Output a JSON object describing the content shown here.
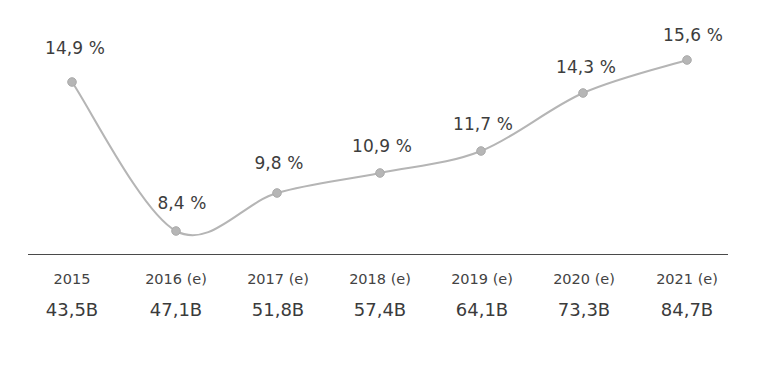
{
  "chart_data": {
    "type": "line",
    "title": "",
    "subtitle": "",
    "xlabel": "",
    "ylabel": "",
    "grid": false,
    "legend": "none",
    "categories": [
      "2015",
      "2016 (e)",
      "2017 (e)",
      "2018 (e)",
      "2019 (e)",
      "2020 (e)",
      "2021 (e)"
    ],
    "values": [
      14.9,
      8.4,
      9.8,
      10.9,
      11.7,
      14.3,
      15.6
    ],
    "point_labels": [
      "14,9 %",
      "8,4 %",
      "9,8 %",
      "10,9 %",
      "11,7 %",
      "14,3 %",
      "15,6 %"
    ],
    "secondary_labels": [
      "43,5B",
      "47,1B",
      "51,8B",
      "57,4B",
      "64,1B",
      "73,3B",
      "84,7B"
    ],
    "secondary_values": [
      43.5,
      47.1,
      51.8,
      57.4,
      64.1,
      73.3,
      84.7
    ],
    "secondary_unit": "B",
    "series": [
      {
        "name": "growth-rate-percent",
        "values": [
          14.9,
          8.4,
          9.8,
          10.9,
          11.7,
          14.3,
          15.6
        ]
      },
      {
        "name": "volume-billions",
        "values": [
          43.5,
          47.1,
          51.8,
          57.4,
          64.1,
          73.3,
          84.7
        ]
      }
    ],
    "ylim": [
      7.5,
      16.5
    ],
    "colors": {
      "line": "#b5b5b5",
      "marker": "#b0b0b0",
      "label_text": "#3d3d3d",
      "axis": "#4a4a4a",
      "background": "#ffffff"
    }
  },
  "points": [
    {
      "x": 72,
      "y": 82,
      "label": "14,9 %",
      "label_x": 75,
      "label_y": 48
    },
    {
      "x": 176,
      "y": 231,
      "label": "8,4 %",
      "label_x": 182,
      "label_y": 203
    },
    {
      "x": 277,
      "y": 193,
      "label": "9,8 %",
      "label_x": 279,
      "label_y": 163
    },
    {
      "x": 380,
      "y": 173,
      "label": "10,9 %",
      "label_x": 382,
      "label_y": 146
    },
    {
      "x": 481,
      "y": 151,
      "label": "11,7 %",
      "label_x": 483,
      "label_y": 124
    },
    {
      "x": 583,
      "y": 93,
      "label": "14,3 %",
      "label_x": 586,
      "label_y": 67
    },
    {
      "x": 687,
      "y": 60,
      "label": "15,6 %",
      "label_x": 693,
      "label_y": 35
    }
  ],
  "axis": {
    "columns": [
      {
        "cx": 72,
        "year": "2015",
        "amount": "43,5B"
      },
      {
        "cx": 176,
        "year": "2016 (e)",
        "amount": "47,1B"
      },
      {
        "cx": 278,
        "year": "2017 (e)",
        "amount": "51,8B"
      },
      {
        "cx": 380,
        "year": "2018 (e)",
        "amount": "57,4B"
      },
      {
        "cx": 482,
        "year": "2019 (e)",
        "amount": "64,1B"
      },
      {
        "cx": 584,
        "year": "2020 (e)",
        "amount": "73,3B"
      },
      {
        "cx": 687,
        "year": "2021 (e)",
        "amount": "84,7B"
      }
    ]
  }
}
